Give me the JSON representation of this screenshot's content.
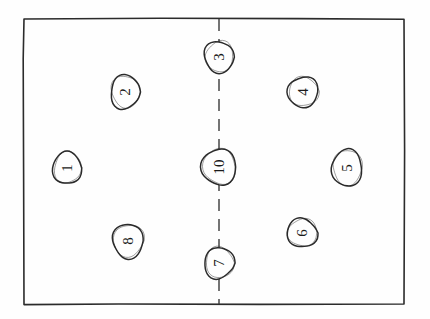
{
  "diagram": {
    "style": "hand-drawn pencil sketch",
    "background_color": "#fefefe",
    "ink_color": "#2b2b2b",
    "court": {
      "name": "court-rectangle",
      "x": 24,
      "y": 19,
      "width": 380,
      "height": 285,
      "stroke_color": "#2b2b2b",
      "stroke_width": 1.6
    },
    "center_line": {
      "name": "dashed-center-line",
      "orientation": "vertical",
      "x": 219,
      "y_start": 19,
      "y_end": 304,
      "dash_length": 12,
      "gap_length": 8,
      "stroke_color": "#3a3a3a",
      "stroke_width": 1.4
    },
    "label_rotation_degrees": -90,
    "positions": [
      {
        "id": "p1",
        "label": "1",
        "cx": 67,
        "cy": 168,
        "rx": 14,
        "ry": 17,
        "side": "left",
        "on_center_line": false
      },
      {
        "id": "p2",
        "label": "2",
        "cx": 125,
        "cy": 92,
        "rx": 15,
        "ry": 17,
        "side": "left",
        "on_center_line": false
      },
      {
        "id": "p3",
        "label": "3",
        "cx": 219,
        "cy": 57,
        "rx": 15,
        "ry": 16,
        "side": "center",
        "on_center_line": true
      },
      {
        "id": "p4",
        "label": "4",
        "cx": 303,
        "cy": 92,
        "rx": 15,
        "ry": 16,
        "side": "right",
        "on_center_line": false
      },
      {
        "id": "p5",
        "label": "5",
        "cx": 347,
        "cy": 168,
        "rx": 16,
        "ry": 18,
        "side": "right",
        "on_center_line": false
      },
      {
        "id": "p6",
        "label": "6",
        "cx": 302,
        "cy": 233,
        "rx": 15,
        "ry": 15,
        "side": "right",
        "on_center_line": false
      },
      {
        "id": "p7",
        "label": "7",
        "cx": 219,
        "cy": 263,
        "rx": 15,
        "ry": 16,
        "side": "center",
        "on_center_line": true
      },
      {
        "id": "p8",
        "label": "8",
        "cx": 128,
        "cy": 241,
        "rx": 16,
        "ry": 17,
        "side": "left",
        "on_center_line": false
      },
      {
        "id": "p10",
        "label": "10",
        "cx": 219,
        "cy": 167,
        "rx": 17,
        "ry": 19,
        "side": "center",
        "on_center_line": true
      }
    ]
  }
}
